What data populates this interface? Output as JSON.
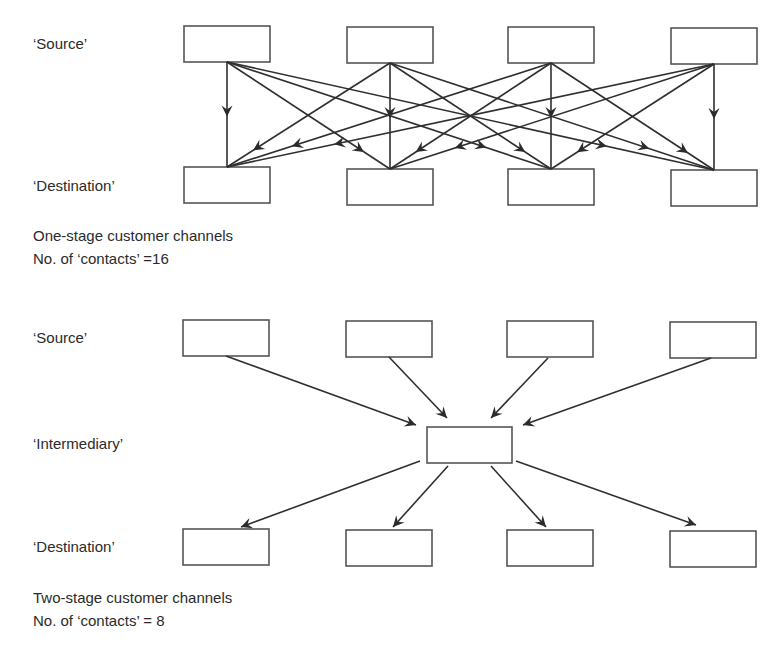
{
  "one_stage": {
    "labels": {
      "source": "‘Source’",
      "destination": "‘Destination’"
    },
    "caption_title": "One-stage customer channels",
    "caption_count": "No. of ‘contacts’ =16",
    "contacts": 16,
    "sources": [
      {
        "x": 184,
        "y": 26,
        "w": 86,
        "h": 36
      },
      {
        "x": 347,
        "y": 27,
        "w": 86,
        "h": 36
      },
      {
        "x": 508,
        "y": 27,
        "w": 86,
        "h": 36
      },
      {
        "x": 671,
        "y": 28,
        "w": 86,
        "h": 36
      }
    ],
    "destinations": [
      {
        "x": 184,
        "y": 167,
        "w": 86,
        "h": 36
      },
      {
        "x": 347,
        "y": 169,
        "w": 86,
        "h": 36
      },
      {
        "x": 508,
        "y": 169,
        "w": 86,
        "h": 36
      },
      {
        "x": 671,
        "y": 170,
        "w": 86,
        "h": 36
      }
    ]
  },
  "two_stage": {
    "labels": {
      "source": "‘Source’",
      "intermediary": "‘Intermediary’",
      "destination": "‘Destination’"
    },
    "caption_title": "Two-stage customer channels",
    "caption_count": "No. of ‘contacts’ = 8",
    "contacts": 8,
    "sources": [
      {
        "x": 183,
        "y": 320,
        "w": 86,
        "h": 36
      },
      {
        "x": 346,
        "y": 321,
        "w": 86,
        "h": 36
      },
      {
        "x": 507,
        "y": 321,
        "w": 86,
        "h": 36
      },
      {
        "x": 670,
        "y": 322,
        "w": 86,
        "h": 36
      }
    ],
    "intermediary": {
      "x": 427,
      "y": 427,
      "w": 85,
      "h": 36
    },
    "destinations": [
      {
        "x": 183,
        "y": 529,
        "w": 86,
        "h": 36
      },
      {
        "x": 346,
        "y": 530,
        "w": 86,
        "h": 36
      },
      {
        "x": 507,
        "y": 530,
        "w": 86,
        "h": 36
      },
      {
        "x": 670,
        "y": 531,
        "w": 86,
        "h": 36
      }
    ],
    "in_edges": [
      {
        "x1": 226,
        "y1": 356,
        "x2": 416,
        "y2": 425
      },
      {
        "x1": 389,
        "y1": 357,
        "x2": 447,
        "y2": 418
      },
      {
        "x1": 548,
        "y1": 358,
        "x2": 491,
        "y2": 418
      },
      {
        "x1": 711,
        "y1": 358,
        "x2": 523,
        "y2": 425
      }
    ],
    "out_edges": [
      {
        "x1": 420,
        "y1": 461,
        "x2": 241,
        "y2": 527
      },
      {
        "x1": 448,
        "y1": 466,
        "x2": 393,
        "y2": 527
      },
      {
        "x1": 491,
        "y1": 466,
        "x2": 546,
        "y2": 527
      },
      {
        "x1": 516,
        "y1": 461,
        "x2": 696,
        "y2": 525
      }
    ]
  },
  "colors": {
    "line": "#2f2f2f",
    "box_stroke": "#555555",
    "text": "#2b2b2b"
  }
}
